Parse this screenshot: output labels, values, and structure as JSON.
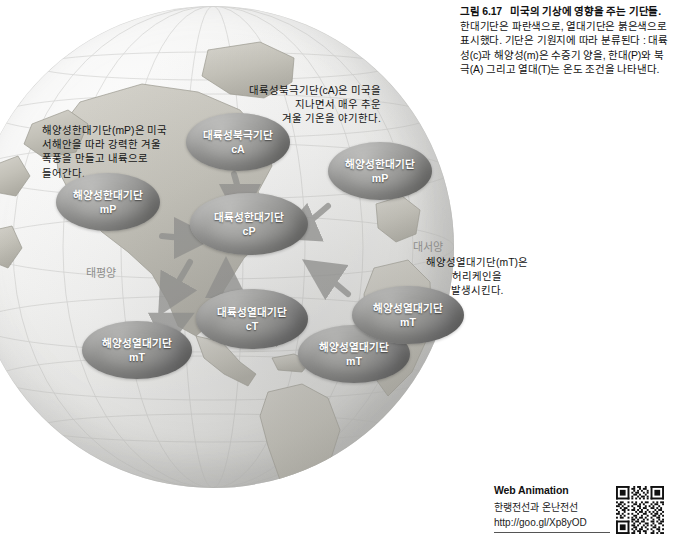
{
  "caption": {
    "figure_number": "그림 6.17",
    "title": "미국의 기상에 영향을 주는 기단들.",
    "body": " 한대기단은 파란색으로, 열대기단은 붉은색으로 표시했다. 기단은 기원지에 따라 분류된다 : 대륙성(c)과 해양성(m)은 수증기 양을, 한대(P)와 북극(A) 그리고 열대(T)는 온도 조건을 나타낸다."
  },
  "map": {
    "ocean_labels": {
      "pacific": "태평양",
      "atlantic": "대서양"
    },
    "annotations": [
      {
        "id": "annot-ca",
        "text": "대륙성북극기단(cA)은 미국을\n지나면서 매우 추운\n겨울 기온을 야기한다."
      },
      {
        "id": "annot-mp",
        "text": "해양성한대기단(mP)은 미국\n서해안을 따라 강력한 겨울\n폭풍을 만들고 내륙으로\n들어간다."
      },
      {
        "id": "annot-mt",
        "text": "해양성열대기단(mT)은\n허리케인을\n발생시킨다."
      }
    ],
    "air_masses": [
      {
        "id": "cA",
        "name": "대륙성북극기단",
        "code": "cA",
        "type": "cold"
      },
      {
        "id": "mP1",
        "name": "해양성한대기단",
        "code": "mP",
        "type": "cold"
      },
      {
        "id": "mP2",
        "name": "해양성한대기단",
        "code": "mP",
        "type": "cold"
      },
      {
        "id": "cP",
        "name": "대륙성한대기단",
        "code": "cP",
        "type": "cold"
      },
      {
        "id": "mT1",
        "name": "해양성열대기단",
        "code": "mT",
        "type": "warm"
      },
      {
        "id": "cT",
        "name": "대륙성열대기단",
        "code": "cT",
        "type": "warm"
      },
      {
        "id": "mT2",
        "name": "해양성열대기단",
        "code": "mT",
        "type": "warm"
      },
      {
        "id": "mT3",
        "name": "해양성열대기단",
        "code": "mT",
        "type": "warm"
      }
    ]
  },
  "web_animation": {
    "title": "Web Animation",
    "subtitle": "한랭전선과 온난전선",
    "url": "http://goo.gl/Xp8yOD"
  },
  "colors": {
    "cold_air_mass": "#8a8a88",
    "warm_air_mass": "#808080",
    "ocean_label": "#8d8d8b",
    "text": "#141414"
  }
}
